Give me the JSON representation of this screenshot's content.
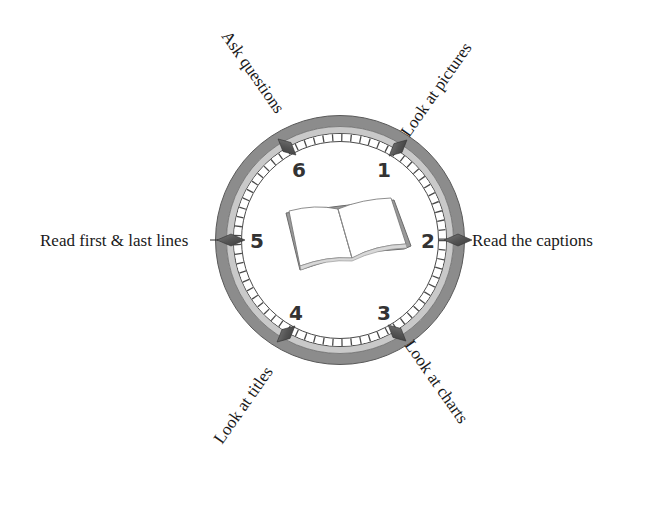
{
  "diagram": {
    "title": "",
    "center_icon": "open-book-icon",
    "steps": [
      {
        "number": "1",
        "label": "Look at pictures"
      },
      {
        "number": "2",
        "label": "Read the captions"
      },
      {
        "number": "3",
        "label": "Look at charts"
      },
      {
        "number": "4",
        "label": "Look at titles"
      },
      {
        "number": "5",
        "label": "Read first & last lines"
      },
      {
        "number": "6",
        "label": "Ask questions"
      }
    ],
    "colors": {
      "outer_band": "#8c8c8c",
      "inner_band": "#c9c9c9",
      "track_line": "#4a4a4a",
      "marker": "#5a5a5a",
      "text": "#1a1a1a"
    }
  }
}
